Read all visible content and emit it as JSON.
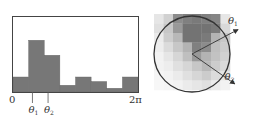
{
  "chart_data": {
    "type": "bar",
    "title": "",
    "xlabel": "",
    "ylabel": "",
    "x_range": [
      "0",
      "2π"
    ],
    "bins": 8,
    "values": [
      0.2,
      0.69,
      0.49,
      0.09,
      0.2,
      0.14,
      0.05,
      0.2
    ],
    "ylim": [
      0,
      1
    ],
    "tick_labels": {
      "start": "0",
      "end": "2π"
    },
    "markers": [
      {
        "label": "θ",
        "subscript": "1",
        "bin_position": 1.5
      },
      {
        "label": "θ",
        "subscript": "2",
        "bin_position": 2.5
      }
    ],
    "bar_color": "#777777",
    "grid": false
  },
  "orientation_diagram": {
    "arrows": [
      {
        "label": "θ",
        "subscript": "1",
        "angle_deg": 28
      },
      {
        "label": "θ",
        "subscript": "2",
        "angle_deg": -35
      }
    ],
    "patch_grid": [
      [
        0.9,
        0.82,
        0.55,
        0.5,
        0.48,
        0.5,
        0.52,
        0.9
      ],
      [
        0.88,
        0.78,
        0.6,
        0.45,
        0.45,
        0.45,
        0.48,
        0.85
      ],
      [
        0.92,
        0.8,
        0.72,
        0.45,
        0.45,
        0.48,
        0.7,
        0.78
      ],
      [
        0.93,
        0.86,
        0.78,
        0.7,
        0.5,
        0.55,
        0.75,
        0.8
      ],
      [
        0.95,
        0.9,
        0.84,
        0.75,
        0.6,
        0.7,
        0.76,
        0.82
      ],
      [
        0.95,
        0.93,
        0.88,
        0.84,
        0.78,
        0.72,
        0.8,
        0.85
      ],
      [
        0.96,
        0.95,
        0.92,
        0.88,
        0.84,
        0.8,
        0.86,
        0.9
      ],
      [
        0.97,
        0.96,
        0.95,
        0.92,
        0.9,
        0.88,
        0.92,
        0.95
      ]
    ],
    "circle_color": "#333333",
    "arrow_color": "#333333"
  }
}
